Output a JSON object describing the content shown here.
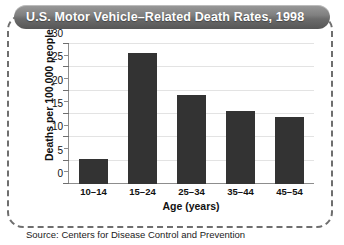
{
  "figure": {
    "title": "U.S. Motor Vehicle–Related Death Rates, 1998",
    "source": "Source: Centers for Disease Control and Prevention",
    "frame_style": "dashed-rounded",
    "title_bar_color": "#7a7a7a",
    "bar_color": "#333333",
    "gridline_color": "#e3e3e3",
    "axis_color": "#8d8d8d"
  },
  "chart_data": {
    "type": "bar",
    "title": "U.S. Motor Vehicle–Related Death Rates, 1998",
    "categories": [
      "10–14",
      "15–24",
      "25–34",
      "35–44",
      "45–54"
    ],
    "values": [
      5.3,
      28.0,
      19.0,
      15.7,
      14.3
    ],
    "xlabel": "Age (years)",
    "ylabel": "Deaths per 100,000 people",
    "ylim": [
      0,
      30
    ],
    "yticks": [
      0,
      5,
      10,
      15,
      20,
      25,
      30
    ],
    "ytick_labels": [
      "0",
      "5",
      "10",
      "15",
      "20",
      "25",
      "30"
    ],
    "minor_tick_step": 2.5,
    "grid": "horizontal",
    "legend": "none"
  }
}
